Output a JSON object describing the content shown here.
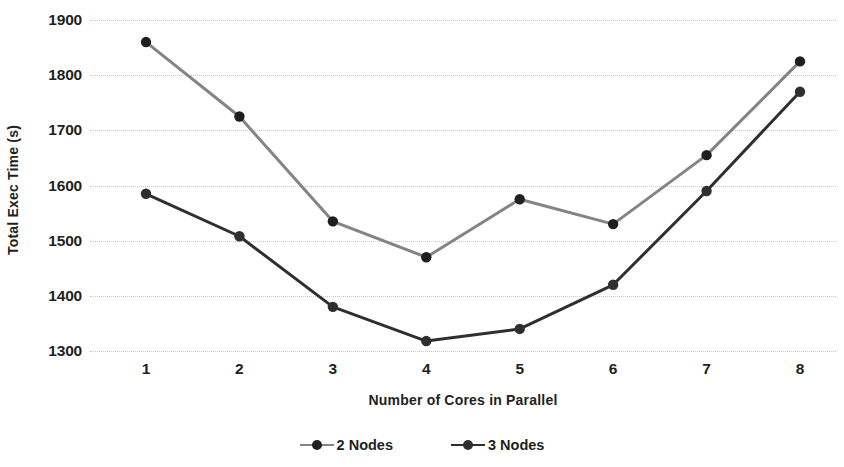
{
  "chart_data": {
    "type": "line",
    "title": "",
    "xlabel": "Number of Cores in Parallel",
    "ylabel": "Total Exec Time (s)",
    "categories": [
      "1",
      "2",
      "3",
      "4",
      "5",
      "6",
      "7",
      "8"
    ],
    "x": [
      1,
      2,
      3,
      4,
      5,
      6,
      7,
      8
    ],
    "xlim": [
      1,
      8
    ],
    "ylim": [
      1300,
      1900
    ],
    "ytick_step": 100,
    "yticks": [
      "1900",
      "1800",
      "1700",
      "1600",
      "1500",
      "1400",
      "1300"
    ],
    "ytick_values": [
      1900,
      1800,
      1700,
      1600,
      1500,
      1400,
      1300
    ],
    "grid": "horizontal-dotted",
    "legend_position": "bottom-center",
    "series": [
      {
        "name": "2 Nodes",
        "color": "#848484",
        "marker": "circle",
        "values": [
          1860,
          1725,
          1535,
          1470,
          1575,
          1530,
          1655,
          1825
        ]
      },
      {
        "name": "3 Nodes",
        "color": "#2f2f2f",
        "marker": "circle",
        "values": [
          1585,
          1508,
          1380,
          1318,
          1340,
          1420,
          1590,
          1770
        ]
      }
    ]
  },
  "legend": {
    "items": [
      {
        "label": "2 Nodes",
        "color": "#848484"
      },
      {
        "label": "3 Nodes",
        "color": "#2f2f2f"
      }
    ]
  },
  "colors": {
    "gridline": "#c9c9c9",
    "text": "#231f20",
    "background": "#ffffff"
  }
}
